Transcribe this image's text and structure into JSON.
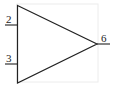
{
  "diagram": {
    "component": "op-amp",
    "symbol": "triangle",
    "pins": [
      {
        "label": "2",
        "side": "left",
        "position": "upper"
      },
      {
        "label": "3",
        "side": "left",
        "position": "lower"
      },
      {
        "label": "6",
        "side": "right",
        "position": "output"
      }
    ],
    "colors": {
      "stroke": "#222222",
      "frame": "#ececec",
      "background": "#ffffff"
    }
  }
}
